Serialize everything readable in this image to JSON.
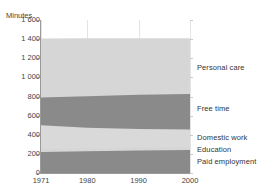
{
  "chart": {
    "title_partial": "",
    "y_axis_caption": "Minutes"
  },
  "chart_data": {
    "type": "area",
    "title": "",
    "xlabel": "",
    "ylabel": "Minutes",
    "ylim": [
      0,
      1600
    ],
    "xlim": [
      1971,
      2000
    ],
    "grid": true,
    "legend_position": "right-inline",
    "stacked": true,
    "x": [
      1971,
      1980,
      1990,
      2000
    ],
    "y_ticks": [
      0,
      200,
      400,
      600,
      800,
      1000,
      1200,
      1400,
      1600
    ],
    "y_tick_labels": [
      "0",
      "200",
      "400",
      "600",
      "800",
      "1 000",
      "1 200",
      "1 400",
      "1 600"
    ],
    "x_tick_labels": [
      "1971",
      "1980",
      "1990",
      "2000"
    ],
    "series": [
      {
        "name": "Paid employment",
        "color": "#8a8a8a",
        "values": [
          220,
          228,
          234,
          240
        ],
        "cumulative_top": [
          220,
          228,
          234,
          240
        ]
      },
      {
        "name": "Education",
        "color": "#d6d6d6",
        "values": [
          30,
          30,
          32,
          32
        ],
        "cumulative_top": [
          250,
          258,
          266,
          272
        ]
      },
      {
        "name": "Domestic work",
        "color": "#d9d9d9",
        "values": [
          250,
          215,
          195,
          183
        ],
        "cumulative_top": [
          500,
          473,
          461,
          455
        ]
      },
      {
        "name": "Free time",
        "color": "#8a8a8a",
        "values": [
          290,
          330,
          358,
          370
        ],
        "cumulative_top": [
          790,
          803,
          819,
          825
        ]
      },
      {
        "name": "Personal care",
        "color": "#d6d6d6",
        "values": [
          616,
          605,
          590,
          585
        ],
        "cumulative_top": [
          1406,
          1408,
          1409,
          1410
        ]
      }
    ]
  },
  "colors": {
    "dark_band": "#8a8a8a",
    "light_band": "#d6d6d6",
    "axis": "#9a9a9a",
    "grid": "#e4e4e4",
    "text": "#333333",
    "background": "#ffffff"
  },
  "series_labels": [
    {
      "name": "Personal care",
      "text": "Personal care"
    },
    {
      "name": "Free time",
      "text": "Free time"
    },
    {
      "name": "Domestic work",
      "text": "Domestic work"
    },
    {
      "name": "Education",
      "text": "Education"
    },
    {
      "name": "Paid employment",
      "text": "Paid employment"
    }
  ]
}
